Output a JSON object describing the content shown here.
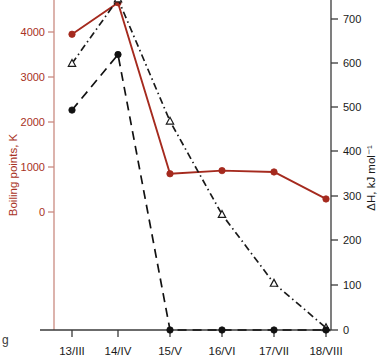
{
  "chart_data": {
    "type": "line",
    "title": "",
    "categories": [
      "13/III",
      "14/IV",
      "15/V",
      "16/VI",
      "17/VII",
      "18/VIII"
    ],
    "xlabel": "",
    "left_axis": {
      "label": "Boiling points, K",
      "ticks": [
        0,
        1000,
        2000,
        3000,
        4000
      ],
      "ylim": [
        -560,
        4700
      ],
      "color": "#a83224"
    },
    "right_axis": {
      "label": "ΔH, kJ mol⁻¹",
      "ticks": [
        0,
        100,
        200,
        300,
        400,
        500,
        600,
        700
      ],
      "ylim": [
        -80,
        745
      ],
      "color": "#1a1a1a"
    },
    "grid": false,
    "legend": "none",
    "series": [
      {
        "name": "boiling-points",
        "axis": "left",
        "line_style": "solid",
        "marker": "filled-circle",
        "color": "#a52a1e",
        "values": [
          3950,
          4650,
          850,
          920,
          890,
          290
        ]
      },
      {
        "name": "delta-h-dashdot",
        "axis": "right",
        "line_style": "dash-dot",
        "marker": "open-triangle",
        "color": "#1a1a1a",
        "values": [
          600,
          745,
          470,
          260,
          105,
          5
        ]
      },
      {
        "name": "delta-h-dashed",
        "axis": "right",
        "line_style": "dashed",
        "marker": "filled-circle",
        "color": "#111111",
        "values": [
          495,
          620,
          0,
          0,
          0,
          0
        ]
      }
    ]
  },
  "caption_fragment": "g"
}
